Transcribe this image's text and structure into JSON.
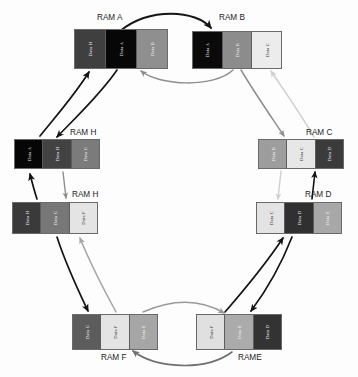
{
  "diagram": {
    "type": "ring-topology",
    "background_color": "#fdfdfd",
    "shade_palette": {
      "Data A": "#0b0b0b",
      "Data B": "#9a9a9a",
      "Data C": "#e9e9e9",
      "Data D": "#3a3a3a",
      "Data E": "#b0b0b0",
      "Data F": "#e4e4e4",
      "Data G": "#808080",
      "Data H": "#4a4a4a"
    }
  },
  "blocks": [
    {
      "id": "ram-a",
      "label": "RAM A",
      "label_x": 97,
      "label_y": 13,
      "x": 74,
      "y": 29,
      "w": 94,
      "h": 40,
      "cells": [
        {
          "text": "Data H",
          "color": "#3f3f3f",
          "text_color": "#ededed"
        },
        {
          "text": "Data A",
          "color": "#070707",
          "text_color": "#e6e6e6"
        },
        {
          "text": "Data B",
          "color": "#8f8f8f",
          "text_color": "#efefef"
        }
      ]
    },
    {
      "id": "ram-b",
      "label": "RAM B",
      "label_x": 219,
      "label_y": 13,
      "x": 192,
      "y": 31,
      "w": 90,
      "h": 38,
      "cells": [
        {
          "text": "Data A",
          "color": "#0a0a0a",
          "text_color": "#e6e6e6"
        },
        {
          "text": "Data B",
          "color": "#8c8c8c",
          "text_color": "#f0f0f0"
        },
        {
          "text": "Data C",
          "color": "#ececec",
          "text_color": "#3a3a3a"
        }
      ]
    },
    {
      "id": "ram-c",
      "label": "RAM C",
      "label_x": 306,
      "label_y": 128,
      "x": 258,
      "y": 139,
      "w": 86,
      "h": 30,
      "cells": [
        {
          "text": "Data B",
          "color": "#9d9d9d",
          "text_color": "#f2f2f2"
        },
        {
          "text": "Data C",
          "color": "#e7e7e7",
          "text_color": "#3c3c3c"
        },
        {
          "text": "Data D",
          "color": "#3b3b3b",
          "text_color": "#ececec"
        }
      ]
    },
    {
      "id": "ram-d",
      "label": "RAM D",
      "label_x": 305,
      "label_y": 190,
      "x": 256,
      "y": 202,
      "w": 86,
      "h": 32,
      "cells": [
        {
          "text": "Data C",
          "color": "#e3e3e3",
          "text_color": "#3c3c3c"
        },
        {
          "text": "Data D",
          "color": "#303030",
          "text_color": "#ececec"
        },
        {
          "text": "Data E",
          "color": "#a8a8a8",
          "text_color": "#f2f2f2"
        }
      ]
    },
    {
      "id": "ram-e",
      "label": "RAME",
      "label_x": 238,
      "label_y": 353,
      "x": 196,
      "y": 314,
      "w": 86,
      "h": 36,
      "cells": [
        {
          "text": "Data F",
          "color": "#e0e0e0",
          "text_color": "#3c3c3c"
        },
        {
          "text": "Data E",
          "color": "#ababab",
          "text_color": "#f2f2f2"
        },
        {
          "text": "Data D",
          "color": "#333333",
          "text_color": "#ececec"
        }
      ]
    },
    {
      "id": "ram-f",
      "label": "RAM F",
      "label_x": 101,
      "label_y": 353,
      "x": 72,
      "y": 314,
      "w": 86,
      "h": 36,
      "cells": [
        {
          "text": "Data G",
          "color": "#5c5c5c",
          "text_color": "#ededed"
        },
        {
          "text": "Data F",
          "color": "#e4e4e4",
          "text_color": "#3c3c3c"
        },
        {
          "text": "Data E",
          "color": "#a6a6a6",
          "text_color": "#f2f2f2"
        }
      ]
    },
    {
      "id": "ram-g",
      "label": "RAM H",
      "label_x": 72,
      "label_y": 190,
      "x": 12,
      "y": 202,
      "w": 86,
      "h": 32,
      "cells": [
        {
          "text": "Data H",
          "color": "#3a3a3a",
          "text_color": "#ececec"
        },
        {
          "text": "Data G",
          "color": "#777777",
          "text_color": "#f0f0f0"
        },
        {
          "text": "Data F",
          "color": "#e4e4e4",
          "text_color": "#3c3c3c"
        }
      ]
    },
    {
      "id": "ram-h",
      "label": "RAM H",
      "label_x": 70,
      "label_y": 128,
      "x": 14,
      "y": 139,
      "w": 86,
      "h": 30,
      "cells": [
        {
          "text": "Data A",
          "color": "#060606",
          "text_color": "#e6e6e6"
        },
        {
          "text": "Data H",
          "color": "#424242",
          "text_color": "#ececec"
        },
        {
          "text": "Data G",
          "color": "#7b7b7b",
          "text_color": "#f0f0f0"
        }
      ]
    }
  ],
  "arrows": [
    {
      "id": "a-to-b",
      "from": "ram-a",
      "to": "ram-b",
      "color": "#141414",
      "width": 1.9,
      "d": "M 120 31 C 150 7 196 10 211 28"
    },
    {
      "id": "b-to-a",
      "from": "ram-b",
      "to": "ram-a",
      "color": "#8e8e8e",
      "width": 1.5,
      "d": "M 233 70 C 214 88 160 86 141 71"
    },
    {
      "id": "a-to-h",
      "from": "ram-a",
      "to": "ram-h",
      "color": "#141414",
      "width": 1.7,
      "d": "M 117 70 C 100 95 75 118 57 137"
    },
    {
      "id": "h-to-a",
      "from": "ram-h",
      "to": "ram-a",
      "color": "#141414",
      "width": 1.7,
      "d": "M 40 136 C 56 116 74 96 89 72"
    },
    {
      "id": "b-to-c",
      "from": "ram-b",
      "to": "ram-c",
      "color": "#8e8e8e",
      "width": 1.5,
      "d": "M 241 70 C 256 95 270 115 284 136"
    },
    {
      "id": "c-to-b",
      "from": "ram-c",
      "to": "ram-b",
      "color": "#cfcfcf",
      "width": 1.5,
      "d": "M 314 137 C 300 113 285 92 271 71"
    },
    {
      "id": "g-to-h",
      "from": "ram-g",
      "to": "ram-h",
      "color": "#141414",
      "width": 1.7,
      "d": "M 37 199 C 34 190 32 182 30 174"
    },
    {
      "id": "h-to-g",
      "from": "ram-h",
      "to": "ram-g",
      "color": "#8e8e8e",
      "width": 1.4,
      "d": "M 63 172 C 64 181 65 190 66 198"
    },
    {
      "id": "c-to-d",
      "from": "ram-c",
      "to": "ram-d",
      "color": "#cfcfcf",
      "width": 1.4,
      "d": "M 281 171 C 280 180 279 190 278 199"
    },
    {
      "id": "d-to-c",
      "from": "ram-d",
      "to": "ram-c",
      "color": "#141414",
      "width": 1.6,
      "d": "M 312 199 C 313 190 314 181 315 172"
    },
    {
      "id": "g-to-f",
      "from": "ram-g",
      "to": "ram-f",
      "color": "#141414",
      "width": 1.7,
      "d": "M 57 237 C 66 265 78 290 88 311"
    },
    {
      "id": "f-to-g",
      "from": "ram-f",
      "to": "ram-g",
      "color": "#a5a5a5",
      "width": 1.5,
      "d": "M 116 312 C 103 288 90 263 80 238"
    },
    {
      "id": "d-to-e",
      "from": "ram-d",
      "to": "ram-e",
      "color": "#141414",
      "width": 1.7,
      "d": "M 292 237 C 281 265 266 291 251 311"
    },
    {
      "id": "e-to-d",
      "from": "ram-e",
      "to": "ram-d",
      "color": "#141414",
      "width": 1.7,
      "d": "M 225 312 C 245 289 267 262 283 238"
    },
    {
      "id": "f-to-e",
      "from": "ram-f",
      "to": "ram-e",
      "color": "#9a9a9a",
      "width": 1.5,
      "d": "M 143 312 C 175 298 202 300 224 313"
    },
    {
      "id": "e-to-f",
      "from": "ram-e",
      "to": "ram-f",
      "color": "#6f6f6f",
      "width": 1.6,
      "d": "M 232 352 C 205 372 155 368 133 351"
    }
  ]
}
